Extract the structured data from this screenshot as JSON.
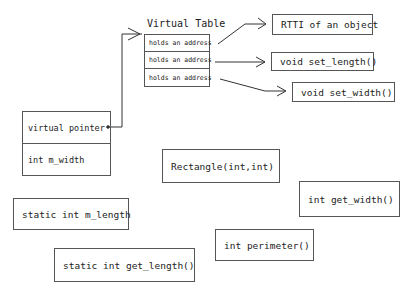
{
  "virtual_table": {
    "title": "Virtual Table",
    "rows": [
      "holds an address",
      "holds an address",
      "holds an address"
    ]
  },
  "object_layout": {
    "rows": [
      "virtual pointer",
      "int m_width"
    ]
  },
  "vtable_targets": [
    "RTTI of an object",
    "void set_length()",
    "void set_width()"
  ],
  "class_members": {
    "constructor": "Rectangle(int,int)",
    "get_width": "int get_width()",
    "static_length": "static int m_length",
    "perimeter": "int perimeter()",
    "static_get_length": "static int get_length()"
  }
}
